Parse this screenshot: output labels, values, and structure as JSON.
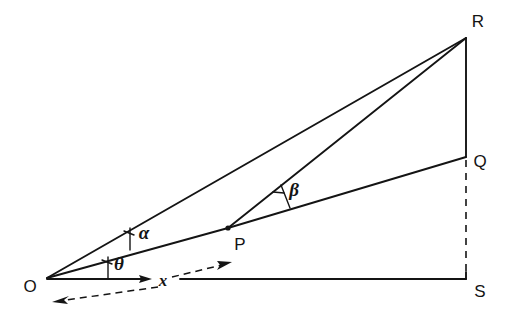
{
  "figure": {
    "background_color": "#ffffff",
    "ink_color": "#141414",
    "vertices": [
      {
        "id": "O",
        "label": "O",
        "x": 47,
        "y": 278,
        "label_x": 30,
        "label_y": 292
      },
      {
        "id": "P",
        "label": "P",
        "x": 228,
        "y": 228,
        "label_x": 236,
        "label_y": 250
      },
      {
        "id": "R",
        "label": "R",
        "x": 466,
        "y": 38,
        "label_x": 474,
        "label_y": 27
      },
      {
        "id": "Q",
        "label": "Q",
        "x": 466,
        "y": 157,
        "label_x": 476,
        "label_y": 167
      },
      {
        "id": "S",
        "label": "S",
        "x": 466,
        "y": 278,
        "label_x": 476,
        "label_y": 297
      }
    ],
    "solid_segments": [
      {
        "name": "O-R",
        "from": "O",
        "to": "R"
      },
      {
        "name": "O-P-Q",
        "from": "O",
        "to": "Q"
      },
      {
        "name": "P-R",
        "from": "P",
        "to": "R"
      },
      {
        "name": "R-S",
        "from": "R",
        "to": "S"
      },
      {
        "name": "baseline-O-to-x",
        "from": "O",
        "to": "x-tick"
      },
      {
        "name": "baseline-x-to-S",
        "from": "x-tick",
        "to": "S"
      }
    ],
    "dashed_segments": [
      {
        "name": "Q-S-vertical",
        "from": "Q",
        "to": "S"
      },
      {
        "name": "x-arrow-right",
        "direction": "right"
      },
      {
        "name": "x-arrow-left",
        "direction": "left"
      }
    ],
    "angles": [
      {
        "id": "theta",
        "label": "θ",
        "at": "O",
        "between": [
          "baseline",
          "O-Q"
        ],
        "label_x": 113,
        "label_y": 270
      },
      {
        "id": "alpha",
        "label": "α",
        "at": "O",
        "between": [
          "O-Q",
          "O-R"
        ],
        "label_x": 137,
        "label_y": 239
      },
      {
        "id": "beta",
        "label": "β",
        "at": "P",
        "between": [
          "P-Q",
          "P-R"
        ],
        "label_x": 288,
        "label_y": 196
      }
    ],
    "axis_label": {
      "id": "x",
      "label": "x",
      "x": 158,
      "y": 286
    }
  }
}
